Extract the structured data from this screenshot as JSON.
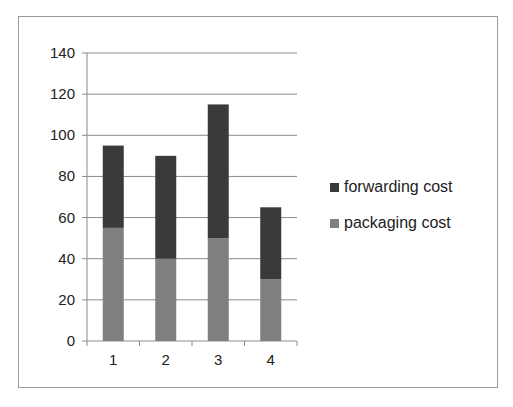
{
  "chart_data": {
    "type": "bar",
    "stacked": true,
    "title": "",
    "xlabel": "",
    "ylabel": "",
    "categories": [
      "1",
      "2",
      "3",
      "4"
    ],
    "series": [
      {
        "name": "packaging cost",
        "values": [
          55,
          40,
          50,
          30
        ],
        "color": "#7f7f7f"
      },
      {
        "name": "forwarding cost",
        "values": [
          40,
          50,
          65,
          35
        ],
        "color": "#3a3a3a"
      }
    ],
    "totals": [
      95,
      90,
      115,
      65
    ],
    "ylim": [
      0,
      140
    ],
    "yticks": [
      0,
      20,
      40,
      60,
      80,
      100,
      120,
      140
    ],
    "grid": true,
    "legend_position": "right",
    "legend_order": [
      "forwarding cost",
      "packaging cost"
    ]
  }
}
